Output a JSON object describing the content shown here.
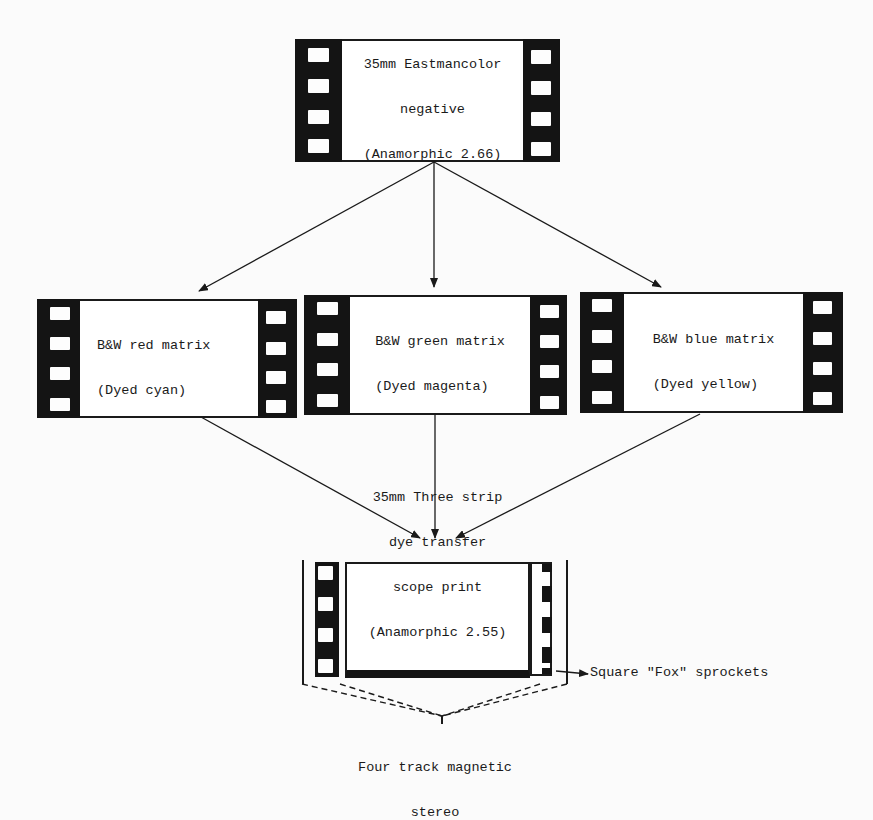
{
  "diagram": {
    "title_fragment": "",
    "nodes": {
      "negative": {
        "lines": [
          "35mm Eastmancolor",
          "negative",
          "(Anamorphic 2.66)"
        ]
      },
      "red_matrix": {
        "lines": [
          "B&W red matrix",
          "(Dyed cyan)"
        ]
      },
      "green_matrix": {
        "lines": [
          "B&W green matrix",
          "(Dyed magenta)"
        ]
      },
      "blue_matrix": {
        "lines": [
          "B&W blue matrix",
          "(Dyed yellow)"
        ]
      },
      "print": {
        "lines": [
          "35mm Three strip",
          "dye transfer",
          "scope print",
          "(Anamorphic 2.55)"
        ]
      }
    },
    "annotations": {
      "sprockets": "Square \"Fox\" sprockets",
      "magnetic_line1": "Four track magnetic",
      "magnetic_line2": "stereo"
    },
    "edges": [
      {
        "from": "negative",
        "to": "red_matrix"
      },
      {
        "from": "negative",
        "to": "green_matrix"
      },
      {
        "from": "negative",
        "to": "blue_matrix"
      },
      {
        "from": "red_matrix",
        "to": "print"
      },
      {
        "from": "green_matrix",
        "to": "print"
      },
      {
        "from": "blue_matrix",
        "to": "print"
      }
    ]
  }
}
